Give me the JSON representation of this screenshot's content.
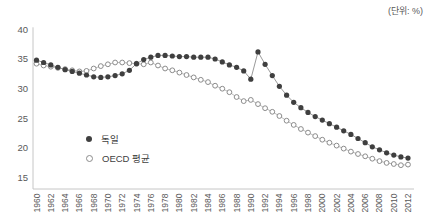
{
  "unit_label": "(단위: %)",
  "colors": {
    "germany_marker": "#3f3f3f",
    "germany_line": "#8f8f8f",
    "oecd_marker_stroke": "#8c8c8c",
    "oecd_line": "#b3b3b3",
    "axis": "#c6c6c6",
    "tick_text": "#595959"
  },
  "chart_data": {
    "type": "line",
    "title": "",
    "xlabel": "",
    "ylabel": "",
    "unit": "(단위: %)",
    "grid": false,
    "legend_position": "inside-left-bottom",
    "x_start": 1960,
    "x_end": 2012,
    "x": [
      1960,
      1961,
      1962,
      1963,
      1964,
      1965,
      1966,
      1967,
      1968,
      1969,
      1970,
      1971,
      1972,
      1973,
      1974,
      1975,
      1976,
      1977,
      1978,
      1979,
      1980,
      1981,
      1982,
      1983,
      1984,
      1985,
      1986,
      1987,
      1988,
      1989,
      1990,
      1991,
      1992,
      1993,
      1994,
      1995,
      1996,
      1997,
      1998,
      1999,
      2000,
      2001,
      2002,
      2003,
      2004,
      2005,
      2006,
      2007,
      2008,
      2009,
      2010,
      2011,
      2012
    ],
    "xticks": [
      1960,
      1962,
      1964,
      1966,
      1968,
      1970,
      1972,
      1974,
      1976,
      1978,
      1980,
      1982,
      1984,
      1986,
      1988,
      1990,
      1992,
      1994,
      1996,
      1998,
      2000,
      2002,
      2004,
      2006,
      2008,
      2010,
      2012
    ],
    "yticks": [
      40,
      35,
      30,
      25,
      20,
      15
    ],
    "ylim": [
      13,
      40.5
    ],
    "series": [
      {
        "name": "독일",
        "marker": "filled-circle",
        "values": [
          34.8,
          34.4,
          34.0,
          33.6,
          33.2,
          32.9,
          32.6,
          32.3,
          32.0,
          31.9,
          32.0,
          32.2,
          32.5,
          33.1,
          34.2,
          34.9,
          35.3,
          35.6,
          35.6,
          35.5,
          35.4,
          35.4,
          35.3,
          35.3,
          35.3,
          35.0,
          34.5,
          34.0,
          33.6,
          33.0,
          31.6,
          36.2,
          34.1,
          32.2,
          30.4,
          28.9,
          27.7,
          26.8,
          26.0,
          25.3,
          24.7,
          24.1,
          23.5,
          22.9,
          22.3,
          21.6,
          20.9,
          20.2,
          19.7,
          19.2,
          18.8,
          18.5,
          18.3
        ]
      },
      {
        "name": "OECD 평균",
        "marker": "open-circle",
        "values": [
          34.2,
          33.9,
          33.7,
          33.5,
          33.3,
          33.1,
          32.9,
          33.0,
          33.4,
          33.8,
          34.1,
          34.4,
          34.4,
          34.3,
          34.2,
          34.1,
          34.4,
          33.9,
          33.4,
          33.1,
          32.7,
          32.3,
          31.9,
          31.5,
          31.1,
          30.5,
          30.0,
          29.4,
          28.6,
          27.9,
          28.1,
          27.4,
          26.7,
          26.1,
          25.4,
          24.6,
          23.9,
          23.2,
          22.6,
          22.0,
          21.4,
          20.9,
          20.4,
          19.9,
          19.4,
          19.0,
          18.6,
          18.2,
          17.8,
          17.5,
          17.3,
          17.1,
          17.2
        ]
      }
    ]
  }
}
